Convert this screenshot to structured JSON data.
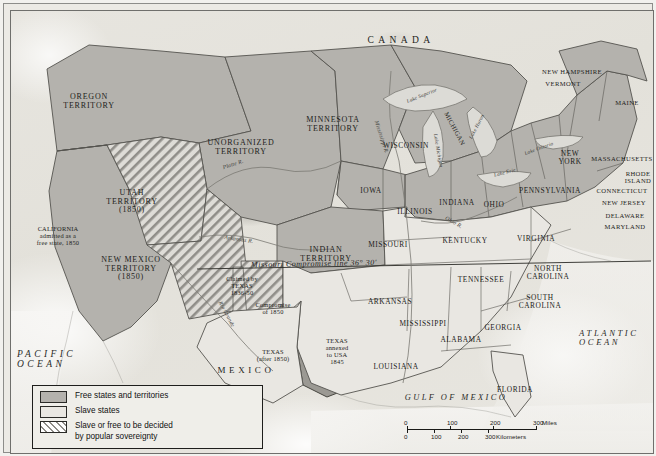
{
  "map": {
    "title_country_north": "CANADA",
    "title_country_south": "MEXICO",
    "ocean_west": "PACIFIC\nOCEAN",
    "ocean_east": "ATLANTIC\nOCEAN",
    "gulf": "GULF OF MEXICO",
    "compromise_line": "Missouri Compromise line 36° 30'",
    "territories": [
      {
        "name": "OREGON\nTERRITORY",
        "x": 78,
        "y": 82
      },
      {
        "name": "UTAH\nTERRITORY\n(1850)",
        "x": 121,
        "y": 178
      },
      {
        "name": "NEW MEXICO\nTERRITORY\n(1850)",
        "x": 120,
        "y": 245
      },
      {
        "name": "UNORGANIZED\nTERRITORY",
        "x": 230,
        "y": 128
      },
      {
        "name": "MINNESOTA\nTERRITORY",
        "x": 322,
        "y": 105
      },
      {
        "name": "INDIAN\nTERRITORY",
        "x": 315,
        "y": 235
      }
    ],
    "states": [
      {
        "name": "WISCONSIN",
        "x": 395,
        "y": 131,
        "size": "state"
      },
      {
        "name": "MICHIGAN",
        "x": 444,
        "y": 114,
        "size": "state-sm",
        "rotate": 62
      },
      {
        "name": "IOWA",
        "x": 360,
        "y": 176,
        "size": "state"
      },
      {
        "name": "ILLINOIS",
        "x": 404,
        "y": 197,
        "size": "state"
      },
      {
        "name": "INDIANA",
        "x": 446,
        "y": 188,
        "size": "state"
      },
      {
        "name": "OHIO",
        "x": 483,
        "y": 190,
        "size": "state"
      },
      {
        "name": "MISSOURI",
        "x": 377,
        "y": 230,
        "size": "state"
      },
      {
        "name": "KENTUCKY",
        "x": 454,
        "y": 226,
        "size": "state"
      },
      {
        "name": "TENNESSEE",
        "x": 470,
        "y": 265,
        "size": "state"
      },
      {
        "name": "ARKANSAS",
        "x": 379,
        "y": 287,
        "size": "state"
      },
      {
        "name": "MISSISSIPPI",
        "x": 412,
        "y": 309,
        "size": "state"
      },
      {
        "name": "ALABAMA",
        "x": 450,
        "y": 325,
        "size": "state"
      },
      {
        "name": "GEORGIA",
        "x": 492,
        "y": 313,
        "size": "state"
      },
      {
        "name": "LOUISIANA",
        "x": 385,
        "y": 352,
        "size": "state"
      },
      {
        "name": "FLORIDA",
        "x": 504,
        "y": 375,
        "size": "state"
      },
      {
        "name": "NORTH\nCAROLINA",
        "x": 537,
        "y": 254,
        "size": "state"
      },
      {
        "name": "SOUTH\nCAROLINA",
        "x": 529,
        "y": 283,
        "size": "state"
      },
      {
        "name": "VIRGINIA",
        "x": 525,
        "y": 224,
        "size": "state"
      },
      {
        "name": "PENNSYLVANIA",
        "x": 539,
        "y": 176,
        "size": "state"
      },
      {
        "name": "NEW\nYORK",
        "x": 559,
        "y": 139,
        "size": "state"
      },
      {
        "name": "MASSACHUSETTS",
        "x": 611,
        "y": 144,
        "size": "state-sm"
      },
      {
        "name": "NEW HAMPSHIRE",
        "x": 561,
        "y": 57,
        "size": "state-sm"
      },
      {
        "name": "VERMONT",
        "x": 552,
        "y": 69,
        "size": "state-sm"
      },
      {
        "name": "MAINE",
        "x": 616,
        "y": 88,
        "size": "state-sm"
      },
      {
        "name": "RHODE\nISLAND",
        "x": 627,
        "y": 159,
        "size": "state-sm"
      },
      {
        "name": "CONNECTICUT",
        "x": 611,
        "y": 176,
        "size": "state-sm"
      },
      {
        "name": "NEW JERSEY",
        "x": 613,
        "y": 188,
        "size": "state-sm"
      },
      {
        "name": "DELAWARE",
        "x": 614,
        "y": 201,
        "size": "state-sm"
      },
      {
        "name": "MARYLAND",
        "x": 614,
        "y": 212,
        "size": "state-sm"
      }
    ],
    "annotations": [
      {
        "name": "CALIFORNIA\nadmitted as a\nfree state, 1850",
        "x": 47,
        "y": 215
      },
      {
        "name": "Claimed by\nTEXAS\n1836-50",
        "x": 231,
        "y": 265
      },
      {
        "name": "Compromise\nof 1850",
        "x": 262,
        "y": 291
      },
      {
        "name": "TEXAS\n(after 1850)",
        "x": 262,
        "y": 338
      },
      {
        "name": "TEXAS\nannexed\nto USA\n1845",
        "x": 326,
        "y": 327
      }
    ],
    "rivers": [
      {
        "name": "Platte R.",
        "x": 222,
        "y": 150,
        "rotate": -18
      },
      {
        "name": "Arkansas R.",
        "x": 228,
        "y": 225,
        "rotate": 8
      },
      {
        "name": "Mississippi R.",
        "x": 371,
        "y": 123,
        "rotate": 72
      },
      {
        "name": "Rio Grande",
        "x": 216,
        "y": 300,
        "rotate": 62
      },
      {
        "name": "Ohio R.",
        "x": 443,
        "y": 208,
        "rotate": 30
      }
    ],
    "lakes": [
      {
        "name": "Lake Superior",
        "x": 411,
        "y": 82,
        "rotate": -22
      },
      {
        "name": "Lake Michigan",
        "x": 427,
        "y": 137,
        "rotate": 80
      },
      {
        "name": "Lake Huron",
        "x": 466,
        "y": 113,
        "rotate": -62
      },
      {
        "name": "Lake Erie",
        "x": 494,
        "y": 159,
        "rotate": -15
      },
      {
        "name": "Lake Ontario",
        "x": 528,
        "y": 135,
        "rotate": -20
      }
    ]
  },
  "legend": {
    "items": [
      {
        "swatch": "free",
        "label": "Free states and territories"
      },
      {
        "swatch": "slave",
        "label": "Slave states"
      },
      {
        "swatch": "pop",
        "label": "Slave or free to be decided\nby popular sovereignty"
      }
    ]
  },
  "scale": {
    "miles_unit": "Miles",
    "km_unit": "Kilometers",
    "miles_ticks": [
      "0",
      "100",
      "200",
      "300"
    ],
    "km_ticks": [
      "0",
      "100",
      "200",
      "300"
    ]
  },
  "colors": {
    "free_fill": "#b4b2ad",
    "slave_fill": "#e9e7e2",
    "popsov_fill": "#dcdad5",
    "texas_annex_fill": "#9b9993",
    "ocean": "#f4f3f0",
    "border_line": "#55544f",
    "frame": "#1e1e1c"
  }
}
